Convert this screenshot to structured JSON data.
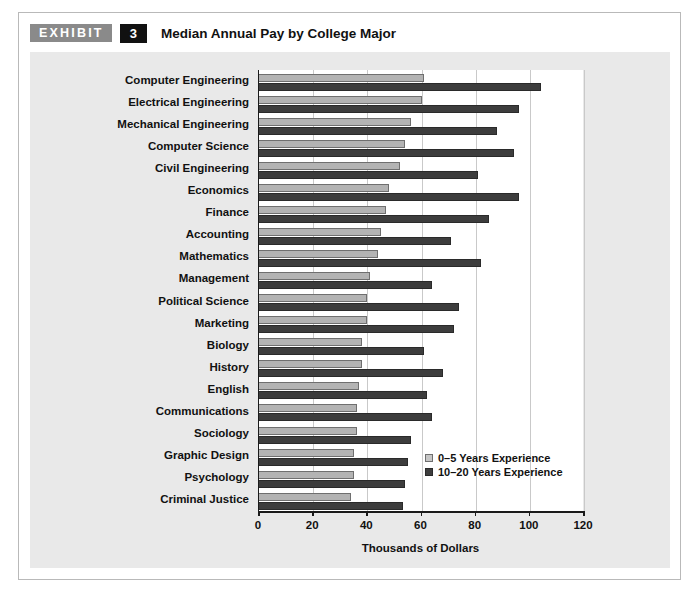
{
  "exhibit": {
    "label": "EXHIBIT",
    "number": "3",
    "title": "Median Annual Pay by College Major"
  },
  "legend": {
    "position": "inside-bottom-right",
    "items": [
      {
        "label": "0–5 Years Experience",
        "color": "#b3b3b3",
        "swatch": "light"
      },
      {
        "label": "10–20 Years Experience",
        "color": "#3d3d3d",
        "swatch": "dark"
      }
    ]
  },
  "axis": {
    "x_title": "Thousands of Dollars",
    "ticks": [
      "0",
      "20",
      "40",
      "60",
      "80",
      "100",
      "120"
    ]
  },
  "colors": {
    "panel_background": "#e9e9e9",
    "plot_background": "#ffffff",
    "gridline": "#c9c9c9",
    "axis": "#1a1a1a",
    "series_0_5": "#b3b3b3",
    "series_10_20": "#3d3d3d",
    "exhibit_label_bg": "#8a8a8a",
    "exhibit_number_bg": "#111111"
  },
  "chart_data": {
    "type": "bar",
    "orientation": "horizontal",
    "title": "Median Annual Pay by College Major",
    "xlabel": "Thousands of Dollars",
    "ylabel": "",
    "xlim": [
      0,
      120
    ],
    "xticks": [
      0,
      20,
      40,
      60,
      80,
      100,
      120
    ],
    "grid": "vertical",
    "legend_position": "inside-bottom-right",
    "categories": [
      "Computer Engineering",
      "Electrical Engineering",
      "Mechanical Engineering",
      "Computer Science",
      "Civil Engineering",
      "Economics",
      "Finance",
      "Accounting",
      "Mathematics",
      "Management",
      "Political Science",
      "Marketing",
      "Biology",
      "History",
      "English",
      "Communications",
      "Sociology",
      "Graphic Design",
      "Psychology",
      "Criminal Justice"
    ],
    "series": [
      {
        "name": "0–5 Years Experience",
        "color": "#b3b3b3",
        "values": [
          61,
          60,
          56,
          54,
          52,
          48,
          47,
          45,
          44,
          41,
          40,
          40,
          38,
          38,
          37,
          36,
          36,
          35,
          35,
          34
        ]
      },
      {
        "name": "10–20 Years Experience",
        "color": "#3d3d3d",
        "values": [
          104,
          96,
          88,
          94,
          81,
          96,
          85,
          71,
          82,
          64,
          74,
          72,
          61,
          68,
          62,
          64,
          56,
          55,
          54,
          53
        ]
      }
    ]
  }
}
